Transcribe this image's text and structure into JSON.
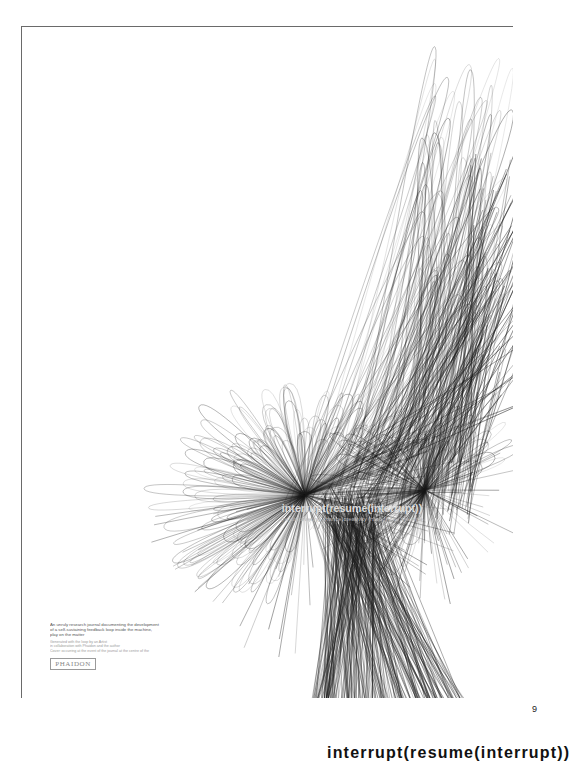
{
  "page": {
    "background": "#ffffff",
    "frame_color": "#6a6a6a",
    "page_number": "9"
  },
  "cover": {
    "title": "interrupt(resume(interrupt))",
    "subtitle": "(re)discovering chance creativity through the machine",
    "title_color": "#dcdcdc",
    "blurb_lines": [
      "An unruly research journal documenting the development",
      "of a self-sustaining feedback loop inside the machine,",
      "play on the matter"
    ],
    "credit_lines": [
      "Generated with the loop by an Artist",
      "in collaboration with Phaidon and the author",
      "Cover: occurring at the event of the journal at the centre of the"
    ],
    "publisher": "PHAIDON",
    "artwork": {
      "ink_color": "#1a1a1a",
      "centres": [
        {
          "x": 284,
          "y": 469,
          "loops": 150,
          "spread": 150
        },
        {
          "x": 404,
          "y": 464,
          "loops": 90,
          "spread": 110
        }
      ],
      "rising_strokes": 70,
      "dark_column": {
        "x1": 290,
        "x2": 450
      }
    }
  },
  "bottom_caption": {
    "text": "interrupt(resume(interrupt))"
  }
}
